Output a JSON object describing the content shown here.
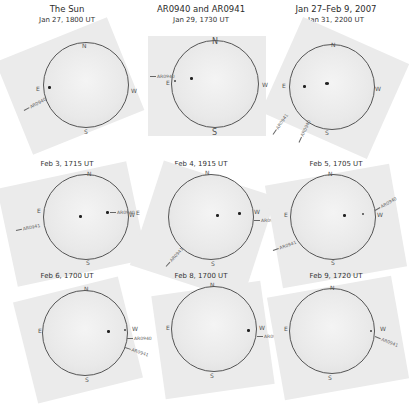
{
  "column_titles": [
    "The Sun",
    "AR0940 and AR0941",
    "Jan 27–Feb 9, 2007"
  ],
  "panels": [
    {
      "caption": "Jan 27, 1800 UT",
      "labels": [
        "AR0940"
      ],
      "directions": {
        "n": "N",
        "s": "S",
        "e": "E",
        "w": "W"
      }
    },
    {
      "caption": "Jan 29, 1730 UT",
      "labels": [
        "AR0940"
      ],
      "directions": {
        "n": "N",
        "s": "S",
        "e": "E",
        "w": "W"
      }
    },
    {
      "caption": "Jan 31, 2200 UT",
      "labels": [
        "AR0941",
        "AR0940"
      ],
      "directions": {
        "n": "N",
        "s": "S",
        "e": "E",
        "w": "W"
      }
    },
    {
      "caption": "Feb 3, 1715 UT",
      "labels": [
        "AR0941",
        "AR0940"
      ],
      "directions": {
        "n": "N",
        "s": "S",
        "e": "E",
        "w": "W"
      }
    },
    {
      "caption": "Feb 4, 1915 UT",
      "labels": [
        "AR0940",
        "AR0941"
      ],
      "directions": {
        "n": "N",
        "s": "S",
        "e": "E",
        "w": "W"
      }
    },
    {
      "caption": "Feb 5, 1705 UT",
      "labels": [
        "AR0940",
        "AR0941"
      ],
      "directions": {
        "n": "N",
        "s": "S",
        "e": "E",
        "w": "W"
      }
    },
    {
      "caption": "Feb 6, 1700 UT",
      "labels": [
        "AR0940",
        "AR0941"
      ],
      "directions": {
        "n": "N",
        "s": "S",
        "e": "E",
        "w": "W"
      }
    },
    {
      "caption": "Feb 8, 1700 UT",
      "labels": [
        "AR0941"
      ],
      "directions": {
        "n": "N",
        "s": "S",
        "e": "E",
        "w": "W"
      }
    },
    {
      "caption": "Feb 9, 1720 UT",
      "labels": [
        "AR0941"
      ],
      "directions": {
        "n": "N",
        "s": "S",
        "e": "E",
        "w": "W"
      }
    }
  ]
}
